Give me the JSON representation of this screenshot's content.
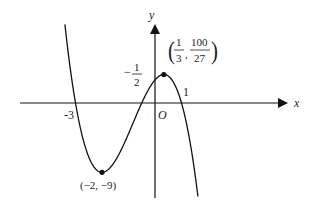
{
  "figure": {
    "function": "f(x) = -2(x+3)(x+1/2)(x-1)",
    "axes": {
      "x_label": "x",
      "y_label": "y",
      "origin_label": "O"
    },
    "x_intercepts": [
      {
        "label": "-3",
        "x": -3
      },
      {
        "label_num": "1",
        "label_den": "2",
        "label_sign": "−",
        "x": -0.5
      },
      {
        "label": "1",
        "x": 1
      }
    ],
    "points": {
      "max": {
        "x": 0.3333,
        "y": 3.7037,
        "label_x_num": "1",
        "label_x_den": "3",
        "label_y_num": "100",
        "label_y_den": "27"
      },
      "min": {
        "x": -2,
        "y": -9,
        "label": "(−2, −9)"
      }
    },
    "colors": {
      "curve": "#111111",
      "axis": "#111111",
      "text": "#222222"
    }
  },
  "chart_data": {
    "type": "line",
    "title": "",
    "xlabel": "x",
    "ylabel": "y",
    "series": [
      {
        "name": "f(x) = -2(x+3)(x+1/2)(x-1)",
        "x": [
          -3.35,
          -3,
          -2.5,
          -2,
          -1.5,
          -1,
          -0.5,
          0,
          0.3333,
          0.5,
          1,
          1.45
        ],
        "y": [
          10.12,
          0,
          -6.0,
          -9,
          -7.5,
          -4.0,
          0,
          3.0,
          3.7,
          3.5,
          0,
          -9.4
        ]
      }
    ],
    "annotations": [
      "(1/3, 100/27)",
      "(−2, −9)",
      "-3",
      "-1/2",
      "1",
      "O"
    ],
    "xlim": [
      -5.1,
      5.5
    ],
    "ylim": [
      -12,
      10.3
    ],
    "grid": false,
    "legend": "none"
  }
}
